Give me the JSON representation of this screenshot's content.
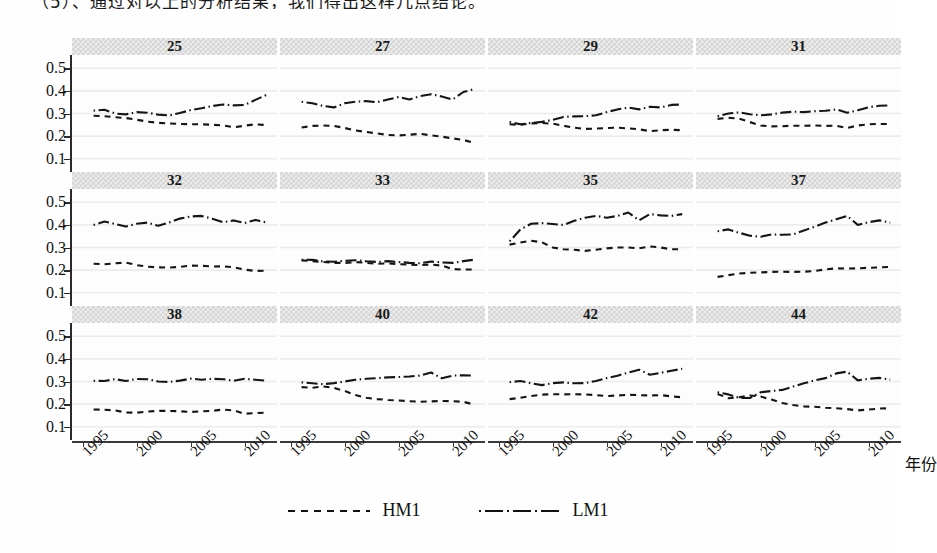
{
  "page": {
    "cut_off_text_top": "（5）、通过对以上的分析结果，我们得出这样几点结论。"
  },
  "axes": {
    "y_ticks": [
      "0.5",
      "0.4",
      "0.3",
      "0.2",
      "0.1"
    ],
    "y_min": 0.05,
    "y_max": 0.55,
    "x_ticks": [
      "1995",
      "2000",
      "2005",
      "2010"
    ],
    "x_title": "年份",
    "x_min": 1994,
    "x_max": 2013
  },
  "legend": {
    "position": "bottom-center",
    "items": [
      {
        "label": "HM1",
        "style": "dashed"
      },
      {
        "label": "LM1",
        "style": "dash-dot"
      }
    ]
  },
  "chart_data": {
    "type": "line",
    "title": "",
    "subtitle": "",
    "xlabel": "年份",
    "ylabel": "",
    "xlim": [
      1994,
      2013
    ],
    "ylim": [
      0.05,
      0.55
    ],
    "grid": true,
    "layout": {
      "rows": 3,
      "cols": 4,
      "strip_titles_on_top": true
    },
    "x": [
      1996,
      1997,
      1998,
      1999,
      2000,
      2001,
      2002,
      2003,
      2004,
      2005,
      2006,
      2007,
      2008,
      2009,
      2010,
      2011,
      2012
    ],
    "panels": [
      {
        "name": "25",
        "series": [
          {
            "name": "HM1",
            "style": "dashed",
            "values": [
              0.29,
              0.288,
              0.283,
              0.28,
              0.272,
              0.264,
              0.259,
              0.256,
              0.254,
              0.252,
              0.252,
              0.25,
              0.247,
              0.239,
              0.246,
              0.252,
              0.249
            ]
          },
          {
            "name": "LM1",
            "style": "dash-dot",
            "values": [
              0.313,
              0.317,
              0.3,
              0.296,
              0.306,
              0.303,
              0.295,
              0.291,
              0.302,
              0.315,
              0.323,
              0.333,
              0.34,
              0.336,
              0.338,
              0.36,
              0.382
            ]
          }
        ]
      },
      {
        "name": "27",
        "series": [
          {
            "name": "HM1",
            "style": "dashed",
            "values": [
              0.238,
              0.245,
              0.247,
              0.245,
              0.236,
              0.225,
              0.218,
              0.212,
              0.205,
              0.203,
              0.206,
              0.21,
              0.203,
              0.198,
              0.19,
              0.183,
              0.17
            ]
          },
          {
            "name": "LM1",
            "style": "dash-dot",
            "values": [
              0.352,
              0.345,
              0.333,
              0.327,
              0.345,
              0.352,
              0.355,
              0.35,
              0.362,
              0.373,
              0.362,
              0.377,
              0.385,
              0.375,
              0.362,
              0.395,
              0.408
            ]
          }
        ]
      },
      {
        "name": "29",
        "series": [
          {
            "name": "HM1",
            "style": "dashed",
            "values": [
              0.252,
              0.25,
              0.256,
              0.258,
              0.255,
              0.246,
              0.237,
              0.232,
              0.233,
              0.236,
              0.237,
              0.234,
              0.23,
              0.222,
              0.226,
              0.228,
              0.226
            ]
          },
          {
            "name": "LM1",
            "style": "dash-dot",
            "values": [
              0.262,
              0.252,
              0.258,
              0.263,
              0.272,
              0.285,
              0.287,
              0.288,
              0.292,
              0.306,
              0.318,
              0.326,
              0.318,
              0.33,
              0.327,
              0.338,
              0.34
            ]
          }
        ]
      },
      {
        "name": "31",
        "series": [
          {
            "name": "HM1",
            "style": "dashed",
            "values": [
              0.276,
              0.281,
              0.277,
              0.262,
              0.247,
              0.243,
              0.244,
              0.246,
              0.246,
              0.247,
              0.245,
              0.246,
              0.236,
              0.247,
              0.252,
              0.254,
              0.253
            ]
          },
          {
            "name": "LM1",
            "style": "dash-dot",
            "values": [
              0.288,
              0.3,
              0.305,
              0.297,
              0.292,
              0.296,
              0.304,
              0.308,
              0.306,
              0.31,
              0.312,
              0.318,
              0.303,
              0.314,
              0.328,
              0.334,
              0.336
            ]
          }
        ]
      },
      {
        "name": "32",
        "series": [
          {
            "name": "HM1",
            "style": "dashed",
            "values": [
              0.228,
              0.226,
              0.23,
              0.233,
              0.222,
              0.215,
              0.212,
              0.211,
              0.214,
              0.22,
              0.219,
              0.216,
              0.217,
              0.213,
              0.202,
              0.196,
              0.198
            ]
          },
          {
            "name": "LM1",
            "style": "dash-dot",
            "values": [
              0.4,
              0.415,
              0.404,
              0.393,
              0.405,
              0.41,
              0.396,
              0.41,
              0.428,
              0.437,
              0.44,
              0.427,
              0.412,
              0.42,
              0.408,
              0.422,
              0.411
            ]
          }
        ]
      },
      {
        "name": "33",
        "series": [
          {
            "name": "HM1",
            "style": "dashed",
            "values": [
              0.243,
              0.24,
              0.236,
              0.232,
              0.232,
              0.236,
              0.232,
              0.228,
              0.23,
              0.226,
              0.224,
              0.222,
              0.225,
              0.22,
              0.205,
              0.202,
              0.203
            ]
          },
          {
            "name": "LM1",
            "style": "dash-dot",
            "values": [
              0.246,
              0.245,
              0.238,
              0.237,
              0.241,
              0.244,
              0.239,
              0.236,
              0.24,
              0.236,
              0.232,
              0.23,
              0.238,
              0.234,
              0.232,
              0.24,
              0.246
            ]
          }
        ]
      },
      {
        "name": "35",
        "series": [
          {
            "name": "HM1",
            "style": "dashed",
            "values": [
              0.313,
              0.322,
              0.33,
              0.323,
              0.3,
              0.292,
              0.29,
              0.285,
              0.29,
              0.296,
              0.3,
              0.3,
              0.296,
              0.305,
              0.3,
              0.292,
              0.292
            ]
          },
          {
            "name": "LM1",
            "style": "dash-dot",
            "values": [
              0.327,
              0.38,
              0.405,
              0.408,
              0.404,
              0.4,
              0.418,
              0.432,
              0.44,
              0.432,
              0.44,
              0.455,
              0.42,
              0.448,
              0.442,
              0.44,
              0.448
            ]
          }
        ]
      },
      {
        "name": "37",
        "series": [
          {
            "name": "HM1",
            "style": "dashed",
            "values": [
              0.17,
              0.178,
              0.185,
              0.188,
              0.19,
              0.192,
              0.193,
              0.192,
              0.193,
              0.196,
              0.203,
              0.208,
              0.207,
              0.208,
              0.21,
              0.212,
              0.214
            ]
          },
          {
            "name": "LM1",
            "style": "dash-dot",
            "values": [
              0.372,
              0.38,
              0.365,
              0.352,
              0.348,
              0.358,
              0.356,
              0.358,
              0.375,
              0.392,
              0.41,
              0.425,
              0.44,
              0.4,
              0.412,
              0.42,
              0.41
            ]
          }
        ]
      },
      {
        "name": "38",
        "series": [
          {
            "name": "HM1",
            "style": "dashed",
            "values": [
              0.176,
              0.175,
              0.172,
              0.163,
              0.162,
              0.167,
              0.17,
              0.17,
              0.168,
              0.165,
              0.168,
              0.17,
              0.176,
              0.172,
              0.157,
              0.16,
              0.162
            ]
          },
          {
            "name": "LM1",
            "style": "dash-dot",
            "values": [
              0.303,
              0.302,
              0.31,
              0.302,
              0.311,
              0.31,
              0.3,
              0.298,
              0.304,
              0.313,
              0.308,
              0.312,
              0.31,
              0.303,
              0.312,
              0.308,
              0.304
            ]
          }
        ]
      },
      {
        "name": "40",
        "series": [
          {
            "name": "HM1",
            "style": "dashed",
            "values": [
              0.275,
              0.272,
              0.278,
              0.272,
              0.258,
              0.24,
              0.228,
              0.222,
              0.218,
              0.216,
              0.213,
              0.21,
              0.212,
              0.214,
              0.213,
              0.21,
              0.198
            ]
          },
          {
            "name": "LM1",
            "style": "dash-dot",
            "values": [
              0.296,
              0.292,
              0.288,
              0.293,
              0.3,
              0.308,
              0.312,
              0.315,
              0.318,
              0.32,
              0.322,
              0.326,
              0.34,
              0.314,
              0.326,
              0.328,
              0.326
            ]
          }
        ]
      },
      {
        "name": "42",
        "series": [
          {
            "name": "HM1",
            "style": "dashed",
            "values": [
              0.222,
              0.228,
              0.236,
              0.242,
              0.244,
              0.243,
              0.244,
              0.243,
              0.24,
              0.236,
              0.238,
              0.241,
              0.24,
              0.238,
              0.24,
              0.234,
              0.23
            ]
          },
          {
            "name": "LM1",
            "style": "dash-dot",
            "values": [
              0.297,
              0.302,
              0.292,
              0.284,
              0.293,
              0.296,
              0.292,
              0.293,
              0.302,
              0.315,
              0.325,
              0.34,
              0.352,
              0.33,
              0.338,
              0.348,
              0.356
            ]
          }
        ]
      },
      {
        "name": "44",
        "series": [
          {
            "name": "HM1",
            "style": "dashed",
            "values": [
              0.245,
              0.226,
              0.23,
              0.238,
              0.233,
              0.22,
              0.205,
              0.196,
              0.19,
              0.188,
              0.184,
              0.182,
              0.178,
              0.172,
              0.176,
              0.18,
              0.182
            ]
          },
          {
            "name": "LM1",
            "style": "dash-dot",
            "values": [
              0.252,
              0.243,
              0.228,
              0.227,
              0.252,
              0.258,
              0.263,
              0.278,
              0.292,
              0.305,
              0.315,
              0.336,
              0.344,
              0.305,
              0.312,
              0.316,
              0.308
            ]
          }
        ]
      }
    ]
  }
}
